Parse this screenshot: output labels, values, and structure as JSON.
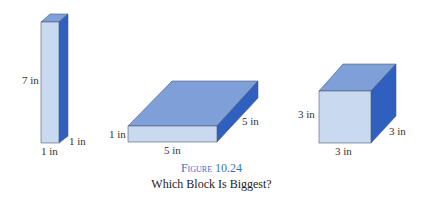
{
  "figure": {
    "number_label": "Figure 10.24",
    "subtitle": "Which Block Is Biggest?"
  },
  "colors": {
    "front": "#c9d9f0",
    "top": "#7f9fd8",
    "side": "#2f5fbf",
    "edge": "#4a5a78",
    "caption": "#3b6fc4"
  },
  "blocks": [
    {
      "name": "tall-block",
      "labels": {
        "height": "7 in",
        "depth": "1 in",
        "width": "1 in"
      }
    },
    {
      "name": "flat-block",
      "labels": {
        "height": "1 in",
        "depth": "5 in",
        "width": "5 in"
      }
    },
    {
      "name": "cube-block",
      "labels": {
        "height": "3 in",
        "depth": "3 in",
        "width": "3 in"
      }
    }
  ]
}
